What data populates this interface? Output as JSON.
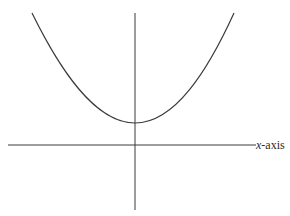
{
  "diagram": {
    "type": "function-graph",
    "curve": "upward-opening U-shaped curve (parabola/catenary) with minimum on vertical axis above x-axis",
    "x_axis_label": {
      "variable": "x",
      "suffix": "-axis"
    },
    "colors": {
      "background": "#ffffff",
      "stroke": "#3a3a3a",
      "text": "#2a2a2a"
    },
    "geometry": {
      "x_axis": {
        "x1": 8,
        "x2": 256,
        "y": 145
      },
      "y_axis": {
        "x": 135,
        "y1": 13,
        "y2": 210
      },
      "curve": {
        "left_end": [
          32,
          13
        ],
        "vertex": [
          135,
          123
        ],
        "right_end": [
          234,
          13
        ]
      }
    }
  }
}
